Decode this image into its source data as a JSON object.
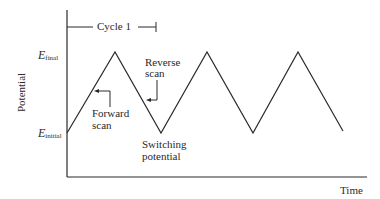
{
  "diagram": {
    "y_axis_label": "Potential",
    "x_axis_label": "Time",
    "cycle_label": "Cycle 1",
    "e_final": {
      "symbol": "E",
      "subscript": "final"
    },
    "e_initial": {
      "symbol": "E",
      "subscript": "initial"
    },
    "annotations": {
      "forward_scan": [
        "Forward",
        "scan"
      ],
      "reverse_scan": [
        "Reverse",
        "scan"
      ],
      "switching_potential": [
        "Switching",
        "potential"
      ]
    },
    "waveform": {
      "type": "triangular",
      "points": [
        [
          67,
          133
        ],
        [
          115,
          52
        ],
        [
          161,
          133
        ],
        [
          207,
          52
        ],
        [
          253,
          133
        ],
        [
          298,
          52
        ],
        [
          343,
          131
        ]
      ]
    },
    "colors": {
      "line": "#2a2a2a",
      "background": "#ffffff"
    }
  }
}
